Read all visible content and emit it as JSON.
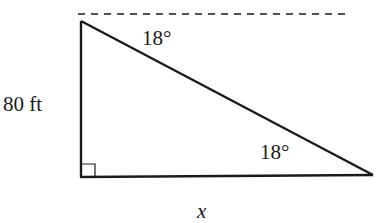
{
  "diagram": {
    "type": "right-triangle",
    "labels": {
      "top_angle": "18°",
      "height": "80 ft",
      "bottom_angle": "18°",
      "base": "x"
    },
    "colors": {
      "stroke": "#1a1a1a",
      "background": "#ffffff"
    },
    "values": {
      "angle_of_depression_deg": 18,
      "angle_of_elevation_deg": 18,
      "height_ft": 80,
      "base_unknown": "x"
    }
  }
}
